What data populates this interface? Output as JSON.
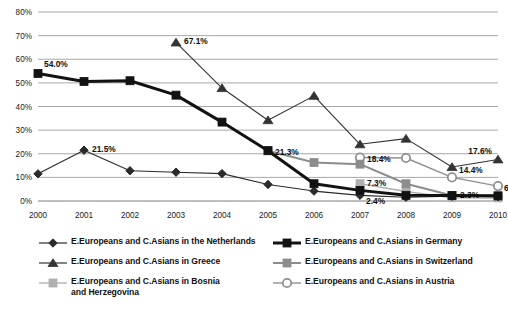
{
  "chart_data": {
    "type": "line",
    "title": "",
    "xlabel": "",
    "ylabel": "",
    "x": [
      2000,
      2001,
      2002,
      2003,
      2004,
      2005,
      2006,
      2007,
      2008,
      2009,
      2010
    ],
    "categories": [
      "2000",
      "2001",
      "2002",
      "2003",
      "2004",
      "2005",
      "2006",
      "2007",
      "2008",
      "2009",
      "2010"
    ],
    "ylim": [
      0,
      80
    ],
    "yticks": [
      0,
      10,
      20,
      30,
      40,
      50,
      60,
      70,
      80
    ],
    "ytick_labels": [
      "0%",
      "10%",
      "20%",
      "30%",
      "40%",
      "50%",
      "60%",
      "70%",
      "80%"
    ],
    "grid": true,
    "legend_position": "bottom",
    "series": [
      {
        "name": "E.Europeans and C.Asians in the Netherlands",
        "marker": "diamond",
        "color": "#2b2b2b",
        "line_width": 1.1,
        "x": [
          2000,
          2001,
          2002,
          2003,
          2004,
          2005,
          2006,
          2007,
          2008,
          2009,
          2010
        ],
        "values": [
          11.5,
          21.5,
          12.8,
          12.2,
          11.6,
          7.0,
          4.2,
          2.4,
          1.6,
          2.0,
          1.8
        ]
      },
      {
        "name": "E.Europeans and C.Asians in Germany",
        "marker": "square",
        "color": "#121212",
        "line_width": 3.0,
        "x": [
          2000,
          2001,
          2002,
          2003,
          2004,
          2005,
          2006,
          2007,
          2008,
          2009,
          2010
        ],
        "values": [
          54.0,
          50.6,
          50.9,
          44.8,
          33.4,
          21.3,
          7.3,
          4.5,
          2.4,
          2.3,
          2.2
        ]
      },
      {
        "name": "E.Europeans and C.Asians in Greece",
        "marker": "triangle",
        "color": "#333333",
        "line_width": 1.1,
        "x": [
          2003,
          2004,
          2005,
          2006,
          2007,
          2008,
          2009,
          2010
        ],
        "values": [
          67.1,
          47.8,
          34.2,
          44.5,
          24.0,
          26.4,
          14.4,
          17.6
        ]
      },
      {
        "name": "E.Europeans and C.Asians in Switzerland",
        "marker": "square",
        "color": "#8c8c8c",
        "line_width": 2.0,
        "x": [
          2005,
          2006,
          2007,
          2008,
          2009,
          2010
        ],
        "values": [
          21.3,
          16.3,
          15.6,
          7.3,
          2.3,
          2.0
        ]
      },
      {
        "name": "E.Europeans and C.Asians in Bosnia and Herzegovina",
        "marker": "square",
        "color": "#b0b0b0",
        "line_width": 1.4,
        "x": [
          2007,
          2008,
          2009,
          2010
        ],
        "values": [
          7.3,
          4.0,
          1.4,
          1.3
        ]
      },
      {
        "name": "E.Europeans and C.Asians in Austria",
        "marker": "circle-open",
        "color": "#909090",
        "line_width": 1.4,
        "x": [
          2007,
          2008,
          2009,
          2010
        ],
        "values": [
          18.4,
          18.2,
          10.0,
          6.3
        ]
      }
    ],
    "annotations": [
      {
        "text": "54.0%",
        "x": 2000,
        "y": 54.0,
        "dx": 6,
        "dy": -9
      },
      {
        "text": "21.5%",
        "x": 2001,
        "y": 21.5,
        "dx": 8,
        "dy": -1
      },
      {
        "text": "67.1%",
        "x": 2003,
        "y": 67.1,
        "dx": 8,
        "dy": -1
      },
      {
        "text": "21.3%",
        "x": 2005,
        "y": 21.3,
        "dx": 7,
        "dy": 1
      },
      {
        "text": "18.4%",
        "x": 2007,
        "y": 18.4,
        "dx": 7,
        "dy": 1
      },
      {
        "text": "7.3%",
        "x": 2007,
        "y": 7.3,
        "dx": 7,
        "dy": -1
      },
      {
        "text": "2.4%",
        "x": 2007,
        "y": 2.4,
        "dx": 6,
        "dy": 6
      },
      {
        "text": "14.4%",
        "x": 2009,
        "y": 14.4,
        "dx": 7,
        "dy": 3
      },
      {
        "text": "2.3%",
        "x": 2009,
        "y": 2.3,
        "dx": 8,
        "dy": -1
      },
      {
        "text": "17.6%",
        "x": 2010,
        "y": 17.6,
        "dx": -6,
        "dy": -8
      },
      {
        "text": "6.3%",
        "x": 2010,
        "y": 6.3,
        "dx": 6,
        "dy": 2
      }
    ]
  },
  "legend": {
    "left_items": [
      {
        "label": "E.Europeans and C.Asians in the Netherlands",
        "marker": "diamond",
        "color": "#2b2b2b",
        "line_width": 1.2
      },
      {
        "label": "E.Europeans and C.Asians in Greece",
        "marker": "triangle",
        "color": "#333333",
        "line_width": 1.2
      },
      {
        "label": "E.Europeans and C.Asians in Bosnia\nand Herzegovina",
        "marker": "square",
        "color": "#b0b0b0",
        "line_width": 1.4
      }
    ],
    "right_items": [
      {
        "label": "E.Europeans and C.Asians in Germany",
        "marker": "square",
        "color": "#121212",
        "line_width": 3.0
      },
      {
        "label": "E.Europeans and C.Asians in Switzerland",
        "marker": "square",
        "color": "#8c8c8c",
        "line_width": 2.0
      },
      {
        "label": "E.Europeans and C.Asians in Austria",
        "marker": "circle-open",
        "color": "#909090",
        "line_width": 1.4
      }
    ]
  },
  "colors": {
    "grid": "#a8a8a8",
    "axis": "#9a9a9a",
    "background": "#ffffff",
    "text": "#111111"
  }
}
